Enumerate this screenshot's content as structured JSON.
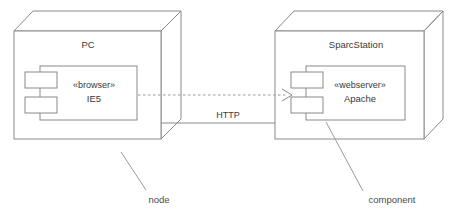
{
  "diagram": {
    "type": "uml-deployment-diagram",
    "stroke_color": "#8a8a8a",
    "text_color": "#3a3a3a",
    "background_color": "#ffffff",
    "nodes": [
      {
        "id": "pc",
        "title": "PC",
        "component": {
          "stereotype": "«browser»",
          "name": "IE5"
        }
      },
      {
        "id": "sparcstation",
        "title": "SparcStation",
        "component": {
          "stereotype": "«webserver»",
          "name": "Apache"
        }
      }
    ],
    "connections": [
      {
        "id": "http-link",
        "label": "HTTP",
        "style": "solid",
        "from": "pc",
        "to": "sparcstation"
      },
      {
        "id": "dependency",
        "label": "",
        "style": "dashed-arrow",
        "from": "ie5",
        "to": "apache"
      }
    ],
    "annotations": [
      {
        "id": "node-annotation",
        "label": "node"
      },
      {
        "id": "component-annotation",
        "label": "component"
      }
    ]
  }
}
